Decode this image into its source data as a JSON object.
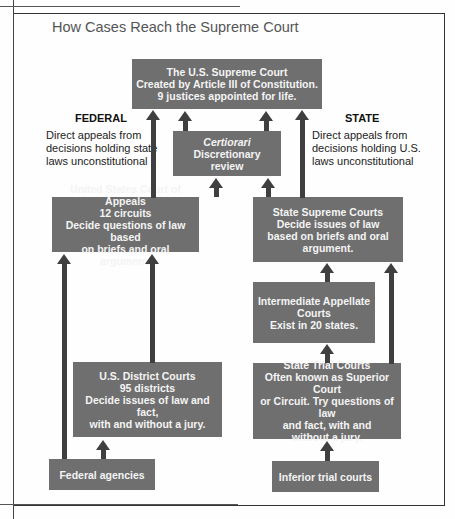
{
  "page": {
    "header_partial": "Process Sch...",
    "title": "How Cases Reach the Supreme Court"
  },
  "colors": {
    "box_fill": "#6f6f6f",
    "box_text": "#f4f4f4",
    "arrow": "#3f3f3f",
    "frame": "#333333"
  },
  "federal": {
    "heading": "FEDERAL",
    "note": [
      "Direct appeals from",
      "decisions holding state",
      "laws unconstitutional"
    ]
  },
  "state": {
    "heading": "STATE",
    "note": [
      "Direct appeals from",
      "decisions holding U.S.",
      "laws unconstitutional"
    ]
  },
  "boxes": {
    "supreme_court": [
      "The U.S. Supreme Court",
      "Created by Article III of Constitution.",
      "9 justices appointed for life."
    ],
    "certiorari": [
      "Certiorari",
      "Discretionary",
      "review"
    ],
    "court_of_appeals": [
      "United States Court of Appeals",
      "12 circuits",
      "Decide questions of law based",
      "on briefs and oral argument."
    ],
    "state_supreme": [
      "State Supreme Courts",
      "Decide issues of law",
      "based on briefs and oral",
      "argument."
    ],
    "intermediate_appellate": [
      "Intermediate Appellate",
      "Courts",
      "Exist in 20 states."
    ],
    "district_courts": [
      "U.S. District Courts",
      "95 districts",
      "Decide issues of law and fact,",
      "with and without a jury."
    ],
    "state_trial": [
      "State Trial Courts",
      "Often known as Superior Court",
      "or Circuit. Try questions of law",
      "and fact, with and",
      "without a jury."
    ],
    "federal_agencies": [
      "Federal agencies"
    ],
    "inferior_trial": [
      "Inferior trial courts"
    ]
  }
}
